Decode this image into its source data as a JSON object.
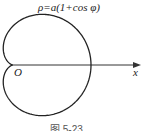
{
  "diagram": {
    "formula": "ρ=a(1+cos φ)",
    "origin_label": "O",
    "axis_label": "x",
    "caption": "图 5-23",
    "curve": "cardioid",
    "stroke_color": "#222222"
  }
}
